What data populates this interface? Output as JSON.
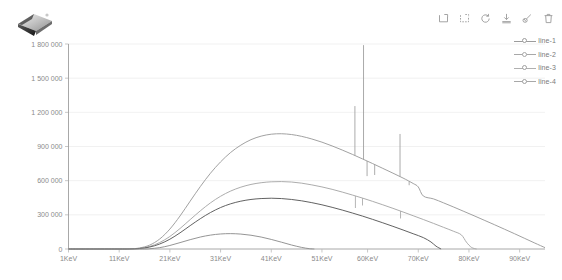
{
  "app": {
    "logo_name": "gem-logo"
  },
  "toolbar": {
    "items": [
      {
        "name": "data-zoom-icon",
        "label": "Data zoom"
      },
      {
        "name": "data-zoom-reset-icon",
        "label": "Data zoom reset"
      },
      {
        "name": "restore-icon",
        "label": "Restore"
      },
      {
        "name": "save-image-icon",
        "label": "Save as image"
      },
      {
        "name": "brush-icon",
        "label": "Brush select"
      },
      {
        "name": "trash-icon",
        "label": "Clear"
      }
    ]
  },
  "legend": {
    "position": "top-right",
    "items": [
      {
        "label": "line-1",
        "color": "#9c9c9c"
      },
      {
        "label": "line-2",
        "color": "#a8a8a8"
      },
      {
        "label": "line-3",
        "color": "#5a5a5a"
      },
      {
        "label": "line-4",
        "color": "#8f8f8f"
      }
    ]
  },
  "chart_data": {
    "type": "line",
    "title": "",
    "subtitle": "",
    "xlabel": "",
    "ylabel": "",
    "grid": true,
    "legend_position": "top-right",
    "xlim": [
      1,
      95
    ],
    "ylim": [
      0,
      1800000
    ],
    "ytick_labels": [
      "0",
      "300 000",
      "600 000",
      "900 000",
      "1 200 000",
      "1 500 000",
      "1 800 000"
    ],
    "ytick_values": [
      0,
      300000,
      600000,
      900000,
      1200000,
      1500000,
      1800000
    ],
    "xtick_labels": [
      "1KeV",
      "11KeV",
      "21KeV",
      "31KeV",
      "41KeV",
      "51KeV",
      "60KeV",
      "70KeV",
      "80KeV",
      "90KeV"
    ],
    "xtick_values": [
      1,
      11,
      21,
      31,
      41,
      51,
      60,
      70,
      80,
      90
    ],
    "x_unit": "KeV",
    "series": [
      {
        "name": "line-1",
        "color": "#9c9c9c",
        "points": [
          [
            1,
            0
          ],
          [
            6,
            0
          ],
          [
            10,
            0
          ],
          [
            13,
            1000
          ],
          [
            15,
            9000
          ],
          [
            17,
            34000
          ],
          [
            19,
            88000
          ],
          [
            21,
            175000
          ],
          [
            23,
            290000
          ],
          [
            25,
            420000
          ],
          [
            27,
            548000
          ],
          [
            29,
            665000
          ],
          [
            31,
            765000
          ],
          [
            33,
            848000
          ],
          [
            35,
            912000
          ],
          [
            37,
            960000
          ],
          [
            39,
            991000
          ],
          [
            41,
            1008000
          ],
          [
            43,
            1012000
          ],
          [
            45,
            1005000
          ],
          [
            47,
            989000
          ],
          [
            49,
            966000
          ],
          [
            51,
            938000
          ],
          [
            53,
            905000
          ],
          [
            55,
            869000
          ],
          [
            57,
            831000
          ],
          [
            59,
            791000
          ],
          [
            61,
            750000
          ],
          [
            63,
            708000
          ],
          [
            65,
            666000
          ],
          [
            67,
            623000
          ],
          [
            69,
            575000
          ],
          [
            70,
            545000
          ],
          [
            71,
            465000
          ],
          [
            73,
            440000
          ],
          [
            75,
            405000
          ],
          [
            77,
            368000
          ],
          [
            79,
            330000
          ],
          [
            81,
            292000
          ],
          [
            83,
            253000
          ],
          [
            85,
            214000
          ],
          [
            87,
            174000
          ],
          [
            89,
            134000
          ],
          [
            91,
            93000
          ],
          [
            93,
            52000
          ],
          [
            95,
            12000
          ]
        ],
        "spikes": [
          {
            "x": 57.5,
            "y": 1255000
          },
          {
            "x": 59.2,
            "y": 1790000
          },
          {
            "x": 59.9,
            "y": 640000
          },
          {
            "x": 61.4,
            "y": 650000
          },
          {
            "x": 66.4,
            "y": 1010000
          },
          {
            "x": 68.2,
            "y": 560000
          }
        ]
      },
      {
        "name": "line-2",
        "color": "#a8a8a8",
        "points": [
          [
            1,
            0
          ],
          [
            10,
            0
          ],
          [
            13,
            600
          ],
          [
            15,
            5500
          ],
          [
            17,
            22000
          ],
          [
            19,
            57000
          ],
          [
            21,
            110000
          ],
          [
            23,
            180000
          ],
          [
            25,
            258000
          ],
          [
            27,
            335000
          ],
          [
            29,
            405000
          ],
          [
            31,
            463000
          ],
          [
            33,
            509000
          ],
          [
            35,
            543000
          ],
          [
            37,
            567000
          ],
          [
            39,
            582000
          ],
          [
            41,
            590000
          ],
          [
            43,
            592000
          ],
          [
            45,
            588000
          ],
          [
            47,
            578000
          ],
          [
            49,
            563000
          ],
          [
            51,
            545000
          ],
          [
            53,
            524000
          ],
          [
            55,
            500000
          ],
          [
            57,
            474000
          ],
          [
            59,
            447000
          ],
          [
            61,
            418000
          ],
          [
            63,
            388000
          ],
          [
            65,
            357000
          ],
          [
            67,
            325000
          ],
          [
            69,
            292000
          ],
          [
            71,
            259000
          ],
          [
            73,
            225000
          ],
          [
            75,
            190000
          ],
          [
            77,
            155000
          ],
          [
            78.5,
            124000
          ],
          [
            79.5,
            60000
          ],
          [
            80.5,
            14000
          ],
          [
            81.5,
            0
          ]
        ],
        "spikes": [
          {
            "x": 57.6,
            "y": 360000
          },
          {
            "x": 59.0,
            "y": 382000
          },
          {
            "x": 66.5,
            "y": 268000
          }
        ]
      },
      {
        "name": "line-3",
        "color": "#5a5a5a",
        "points": [
          [
            1,
            0
          ],
          [
            11,
            0
          ],
          [
            13,
            400
          ],
          [
            15,
            4200
          ],
          [
            17,
            17000
          ],
          [
            19,
            44000
          ],
          [
            21,
            86000
          ],
          [
            23,
            142000
          ],
          [
            25,
            205000
          ],
          [
            27,
            266000
          ],
          [
            29,
            320000
          ],
          [
            31,
            364000
          ],
          [
            33,
            397000
          ],
          [
            35,
            420000
          ],
          [
            37,
            435000
          ],
          [
            39,
            443000
          ],
          [
            41,
            446000
          ],
          [
            43,
            443000
          ],
          [
            45,
            435000
          ],
          [
            47,
            423000
          ],
          [
            49,
            407000
          ],
          [
            51,
            388000
          ],
          [
            53,
            366000
          ],
          [
            55,
            342000
          ],
          [
            57,
            316000
          ],
          [
            59,
            289000
          ],
          [
            61,
            260000
          ],
          [
            63,
            230000
          ],
          [
            65,
            199000
          ],
          [
            67,
            167000
          ],
          [
            69,
            134000
          ],
          [
            71,
            100000
          ],
          [
            72.5,
            62000
          ],
          [
            73.5,
            25000
          ],
          [
            74.5,
            0
          ]
        ],
        "spikes": []
      },
      {
        "name": "line-4",
        "color": "#8f8f8f",
        "points": [
          [
            1,
            0
          ],
          [
            15,
            0
          ],
          [
            17,
            2500
          ],
          [
            19,
            12000
          ],
          [
            21,
            31000
          ],
          [
            23,
            56000
          ],
          [
            25,
            82000
          ],
          [
            27,
            105000
          ],
          [
            29,
            122000
          ],
          [
            31,
            132000
          ],
          [
            33,
            135000
          ],
          [
            35,
            131000
          ],
          [
            37,
            121000
          ],
          [
            39,
            105000
          ],
          [
            41,
            84000
          ],
          [
            43,
            60000
          ],
          [
            45,
            35000
          ],
          [
            47,
            14000
          ],
          [
            48.5,
            3000
          ],
          [
            49.5,
            0
          ]
        ],
        "spikes": []
      }
    ]
  }
}
